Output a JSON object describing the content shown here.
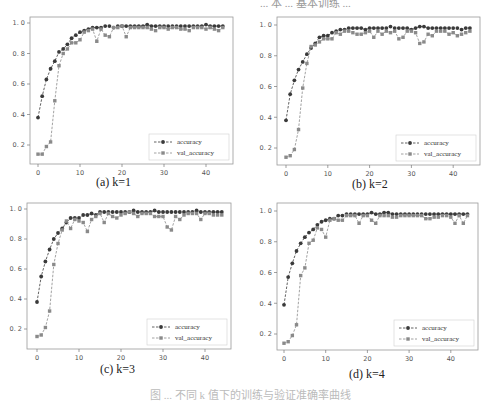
{
  "figure": {
    "caption": "图 ... 不同 k 值下的训练与验证准确率曲线",
    "top_text": "... 本 ... 基本训练 ..."
  },
  "chart_data": [
    {
      "type": "line",
      "panel": "a",
      "title": "",
      "caption": "(a)  k=1",
      "xlabel": "",
      "ylabel": "",
      "xlim": [
        -2,
        46
      ],
      "ylim": [
        0.1,
        1.02
      ],
      "xticks": [
        0,
        10,
        20,
        30,
        40
      ],
      "yticks": [
        0.2,
        0.4,
        0.6,
        0.8,
        1.0
      ],
      "ytick_labels": [
        "0.2",
        "0.4",
        "0.6",
        "0.8",
        "1.0"
      ],
      "grid": false,
      "legend_position": "lower right",
      "x": [
        0,
        1,
        2,
        3,
        4,
        5,
        6,
        7,
        8,
        9,
        10,
        11,
        12,
        13,
        14,
        15,
        16,
        17,
        18,
        19,
        20,
        21,
        22,
        23,
        24,
        25,
        26,
        27,
        28,
        29,
        30,
        31,
        32,
        33,
        34,
        35,
        36,
        37,
        38,
        39,
        40,
        41,
        42,
        43,
        44
      ],
      "series": [
        {
          "name": "accuracy",
          "marker": "circle",
          "linestyle": "dashed",
          "color": "#3a3a3a",
          "values": [
            0.38,
            0.52,
            0.63,
            0.7,
            0.75,
            0.81,
            0.83,
            0.86,
            0.9,
            0.92,
            0.94,
            0.95,
            0.96,
            0.97,
            0.97,
            0.97,
            0.98,
            0.98,
            0.97,
            0.98,
            0.98,
            0.98,
            0.98,
            0.98,
            0.98,
            0.98,
            0.99,
            0.98,
            0.98,
            0.98,
            0.98,
            0.98,
            0.98,
            0.98,
            0.98,
            0.98,
            0.98,
            0.98,
            0.98,
            0.98,
            0.99,
            0.98,
            0.98,
            0.98,
            0.98
          ]
        },
        {
          "name": "val_accuracy",
          "marker": "square",
          "linestyle": "dashed",
          "color": "#8a8a8a",
          "values": [
            0.14,
            0.14,
            0.19,
            0.22,
            0.49,
            0.72,
            0.8,
            0.83,
            0.87,
            0.87,
            0.89,
            0.94,
            0.95,
            0.96,
            0.88,
            0.96,
            0.92,
            0.91,
            0.97,
            0.97,
            0.98,
            0.91,
            0.97,
            0.97,
            0.97,
            0.97,
            0.97,
            0.96,
            0.95,
            0.97,
            0.97,
            0.96,
            0.97,
            0.97,
            0.96,
            0.96,
            0.95,
            0.97,
            0.97,
            0.97,
            0.96,
            0.97,
            0.96,
            0.95,
            0.97
          ]
        }
      ]
    },
    {
      "type": "line",
      "panel": "b",
      "title": "",
      "caption": "(b)  k=2",
      "xlabel": "",
      "ylabel": "",
      "xlim": [
        -2,
        46
      ],
      "ylim": [
        0.1,
        1.02
      ],
      "xticks": [
        0,
        10,
        20,
        30,
        40
      ],
      "yticks": [
        0.2,
        0.4,
        0.6,
        0.8,
        1.0
      ],
      "ytick_labels": [
        "0.2",
        "0.4",
        "0.6",
        "0.8",
        "1.0"
      ],
      "grid": false,
      "legend_position": "lower right",
      "x": [
        0,
        1,
        2,
        3,
        4,
        5,
        6,
        7,
        8,
        9,
        10,
        11,
        12,
        13,
        14,
        15,
        16,
        17,
        18,
        19,
        20,
        21,
        22,
        23,
        24,
        25,
        26,
        27,
        28,
        29,
        30,
        31,
        32,
        33,
        34,
        35,
        36,
        37,
        38,
        39,
        40,
        41,
        42,
        43,
        44
      ],
      "series": [
        {
          "name": "accuracy",
          "marker": "circle",
          "linestyle": "dashed",
          "color": "#3a3a3a",
          "values": [
            0.38,
            0.55,
            0.64,
            0.71,
            0.76,
            0.81,
            0.85,
            0.88,
            0.92,
            0.93,
            0.93,
            0.95,
            0.96,
            0.97,
            0.97,
            0.98,
            0.98,
            0.98,
            0.98,
            0.97,
            0.98,
            0.98,
            0.98,
            0.98,
            0.98,
            0.99,
            0.98,
            0.98,
            0.98,
            0.98,
            0.97,
            0.98,
            0.99,
            0.99,
            0.98,
            0.98,
            0.98,
            0.98,
            0.98,
            0.98,
            0.98,
            0.98,
            0.97,
            0.98,
            0.98
          ]
        },
        {
          "name": "val_accuracy",
          "marker": "square",
          "linestyle": "dashed",
          "color": "#8a8a8a",
          "values": [
            0.14,
            0.15,
            0.19,
            0.32,
            0.59,
            0.75,
            0.86,
            0.87,
            0.89,
            0.91,
            0.91,
            0.91,
            0.95,
            0.94,
            0.96,
            0.96,
            0.95,
            0.94,
            0.94,
            0.95,
            0.96,
            0.92,
            0.96,
            0.94,
            0.96,
            0.95,
            0.96,
            0.91,
            0.92,
            0.96,
            0.96,
            0.95,
            0.88,
            0.89,
            0.94,
            0.93,
            0.96,
            0.96,
            0.96,
            0.94,
            0.95,
            0.93,
            0.94,
            0.95,
            0.96
          ]
        }
      ]
    },
    {
      "type": "line",
      "panel": "c",
      "title": "",
      "caption": "(c)  k=3",
      "xlabel": "",
      "ylabel": "",
      "xlim": [
        -2,
        46
      ],
      "ylim": [
        0.1,
        1.02
      ],
      "xticks": [
        0,
        10,
        20,
        30,
        40
      ],
      "yticks": [
        0.2,
        0.4,
        0.6,
        0.8,
        1.0
      ],
      "ytick_labels": [
        "0.2",
        "0.4",
        "0.6",
        "0.8",
        "1.0"
      ],
      "grid": false,
      "legend_position": "lower right",
      "x": [
        0,
        1,
        2,
        3,
        4,
        5,
        6,
        7,
        8,
        9,
        10,
        11,
        12,
        13,
        14,
        15,
        16,
        17,
        18,
        19,
        20,
        21,
        22,
        23,
        24,
        25,
        26,
        27,
        28,
        29,
        30,
        31,
        32,
        33,
        34,
        35,
        36,
        37,
        38,
        39,
        40,
        41,
        42,
        43,
        44
      ],
      "series": [
        {
          "name": "accuracy",
          "marker": "circle",
          "linestyle": "dashed",
          "color": "#3a3a3a",
          "values": [
            0.38,
            0.55,
            0.65,
            0.73,
            0.8,
            0.84,
            0.87,
            0.91,
            0.94,
            0.94,
            0.94,
            0.96,
            0.96,
            0.97,
            0.96,
            0.98,
            0.98,
            0.98,
            0.98,
            0.98,
            0.98,
            0.98,
            0.98,
            0.99,
            0.98,
            0.98,
            0.98,
            0.98,
            0.99,
            0.98,
            0.98,
            0.98,
            0.98,
            0.98,
            0.98,
            0.98,
            0.98,
            0.98,
            0.99,
            0.98,
            0.98,
            0.98,
            0.98,
            0.98,
            0.98
          ]
        },
        {
          "name": "val_accuracy",
          "marker": "square",
          "linestyle": "dashed",
          "color": "#8a8a8a",
          "values": [
            0.15,
            0.16,
            0.21,
            0.32,
            0.63,
            0.77,
            0.86,
            0.92,
            0.87,
            0.93,
            0.92,
            0.91,
            0.85,
            0.93,
            0.95,
            0.97,
            0.91,
            0.97,
            0.95,
            0.94,
            0.96,
            0.97,
            0.98,
            0.97,
            0.95,
            0.97,
            0.97,
            0.97,
            0.95,
            0.95,
            0.95,
            0.88,
            0.86,
            0.95,
            0.93,
            0.96,
            0.97,
            0.97,
            0.97,
            0.93,
            0.97,
            0.97,
            0.96,
            0.96,
            0.96
          ]
        }
      ]
    },
    {
      "type": "line",
      "panel": "d",
      "title": "",
      "caption": "(d)  k=4",
      "xlabel": "",
      "ylabel": "",
      "xlim": [
        -2,
        46
      ],
      "ylim": [
        0.1,
        1.02
      ],
      "xticks": [
        0,
        10,
        20,
        30,
        40
      ],
      "yticks": [
        0.2,
        0.4,
        0.6,
        0.8,
        1.0
      ],
      "ytick_labels": [
        "0.2",
        "0.4",
        "0.6",
        "0.8",
        "1.0"
      ],
      "grid": false,
      "legend_position": "lower right",
      "x": [
        0,
        1,
        2,
        3,
        4,
        5,
        6,
        7,
        8,
        9,
        10,
        11,
        12,
        13,
        14,
        15,
        16,
        17,
        18,
        19,
        20,
        21,
        22,
        23,
        24,
        25,
        26,
        27,
        28,
        29,
        30,
        31,
        32,
        33,
        34,
        35,
        36,
        37,
        38,
        39,
        40,
        41,
        42,
        43,
        44
      ],
      "series": [
        {
          "name": "accuracy",
          "marker": "circle",
          "linestyle": "dashed",
          "color": "#3a3a3a",
          "values": [
            0.39,
            0.57,
            0.66,
            0.74,
            0.79,
            0.83,
            0.86,
            0.88,
            0.91,
            0.93,
            0.94,
            0.95,
            0.95,
            0.97,
            0.97,
            0.98,
            0.98,
            0.98,
            0.98,
            0.98,
            0.98,
            0.99,
            0.98,
            0.98,
            0.99,
            0.99,
            0.98,
            0.98,
            0.98,
            0.98,
            0.98,
            0.98,
            0.98,
            0.98,
            0.98,
            0.98,
            0.98,
            0.98,
            0.98,
            0.98,
            0.98,
            0.98,
            0.98,
            0.98,
            0.98
          ]
        },
        {
          "name": "val_accuracy",
          "marker": "square",
          "linestyle": "dashed",
          "color": "#8a8a8a",
          "values": [
            0.14,
            0.15,
            0.19,
            0.26,
            0.58,
            0.63,
            0.79,
            0.81,
            0.89,
            0.88,
            0.83,
            0.94,
            0.95,
            0.94,
            0.94,
            0.97,
            0.97,
            0.97,
            0.92,
            0.97,
            0.97,
            0.94,
            0.92,
            0.97,
            0.97,
            0.97,
            0.96,
            0.96,
            0.97,
            0.97,
            0.97,
            0.97,
            0.97,
            0.97,
            0.95,
            0.95,
            0.96,
            0.96,
            0.97,
            0.97,
            0.96,
            0.92,
            0.97,
            0.92,
            0.97
          ]
        }
      ]
    }
  ]
}
